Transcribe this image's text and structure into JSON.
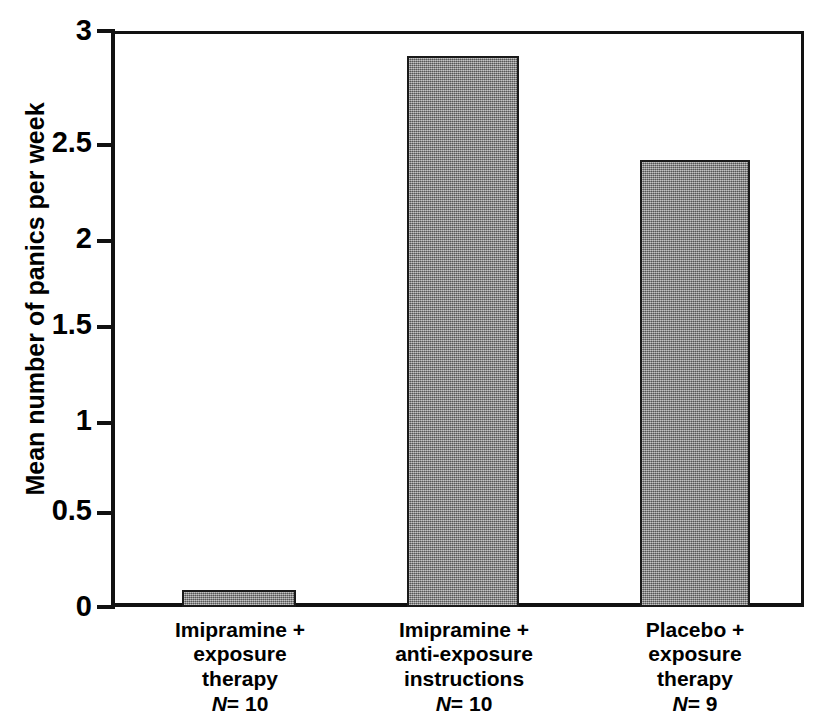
{
  "chart_data": {
    "type": "bar",
    "title": "",
    "xlabel": "",
    "ylabel": "Mean number of panics per week",
    "ylim": [
      0,
      3
    ],
    "grid": false,
    "legend": "none",
    "yticks": [
      "0",
      "0.5",
      "1",
      "1.5",
      "2",
      "2.5",
      "3"
    ],
    "ytick_values": [
      0,
      0.5,
      1,
      1.5,
      2,
      2.5,
      3
    ],
    "categories": [
      "Imipramine + exposure therapy",
      "Imipramine + anti-exposure instructions",
      "Placebo + exposure therapy"
    ],
    "values": [
      0.09,
      2.87,
      2.33
    ],
    "bar_color": "#8a8a8a",
    "bar_edge_color": "#1a1a1a",
    "axis_color": "#111111",
    "background_color": "#ffffff"
  },
  "axis": {
    "y_title": "Mean number of panics per week",
    "ticks": [
      {
        "label": "3",
        "value": 3
      },
      {
        "label": "2.5",
        "value": 2.5
      },
      {
        "label": "2",
        "value": 2
      },
      {
        "label": "1.5",
        "value": 1.5
      },
      {
        "label": "1",
        "value": 1
      },
      {
        "label": "0.5",
        "value": 0.5
      },
      {
        "label": "0",
        "value": 0
      }
    ]
  },
  "categories": [
    {
      "lines": [
        "Imipramine +",
        "exposure",
        "therapy"
      ],
      "n_prefix": "N",
      "n_equals": "=",
      "n_value": "10",
      "value": 0.09
    },
    {
      "lines": [
        "Imipramine +",
        "anti-exposure",
        "instructions"
      ],
      "n_prefix": "N",
      "n_equals": "=",
      "n_value": "10",
      "value": 2.87
    },
    {
      "lines": [
        "Placebo +",
        "exposure",
        "therapy"
      ],
      "n_prefix": "N",
      "n_equals": "=",
      "n_value": "9",
      "value": 2.33
    }
  ]
}
